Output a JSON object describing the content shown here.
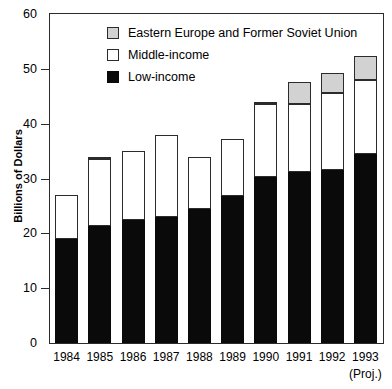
{
  "chart_data": {
    "type": "bar",
    "stacked": true,
    "title": "",
    "xlabel": "",
    "ylabel": "Billions of Dollars",
    "ylim": [
      0,
      60
    ],
    "yticks": [
      0,
      10,
      20,
      30,
      40,
      50,
      60
    ],
    "ytick_labels": [
      "0",
      "10",
      "20",
      "30",
      "40",
      "50",
      "60"
    ],
    "grid": false,
    "legend_position": "top-left-inside",
    "categories": [
      "1984",
      "1985",
      "1986",
      "1987",
      "1988",
      "1989",
      "1990",
      "1991",
      "1992",
      "1993"
    ],
    "category_sublabels": [
      "",
      "",
      "",
      "",
      "",
      "",
      "",
      "",
      "",
      "(Proj.)"
    ],
    "series": [
      {
        "name": "Low-income",
        "color": "#0a0a0a",
        "values": [
          19.0,
          21.4,
          22.4,
          23.0,
          24.5,
          26.8,
          30.2,
          31.2,
          31.6,
          34.4
        ]
      },
      {
        "name": "Middle-income",
        "color": "#ffffff",
        "values": [
          8.0,
          12.2,
          12.6,
          15.0,
          9.5,
          10.4,
          13.3,
          12.4,
          14.0,
          13.6
        ]
      },
      {
        "name": "Eastern Europe and Former Soviet Union",
        "color": "#d2d2d2",
        "values": [
          0.0,
          0.4,
          0.0,
          0.0,
          0.0,
          0.0,
          0.5,
          4.0,
          3.7,
          4.4
        ]
      }
    ],
    "totals": [
      27.0,
      34.0,
      35.0,
      38.0,
      34.0,
      37.2,
      44.0,
      47.6,
      49.3,
      52.4
    ]
  },
  "legend": {
    "items": [
      {
        "label": "Eastern Europe and Former Soviet Union",
        "swatch": "east"
      },
      {
        "label": "Middle-income",
        "swatch": "mid"
      },
      {
        "label": "Low-income",
        "swatch": "low"
      }
    ]
  }
}
